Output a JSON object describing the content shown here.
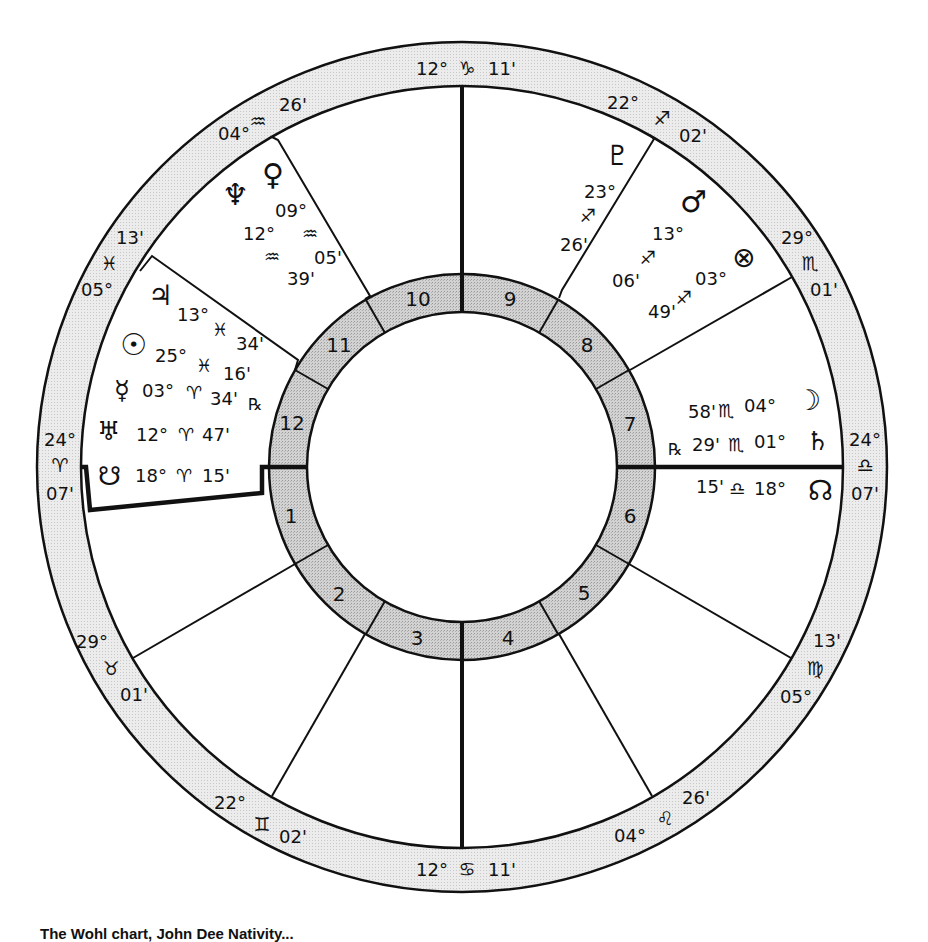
{
  "chart": {
    "center": [
      462,
      467
    ],
    "ring_fill": "#e6e6e6",
    "house_ring_fill": "#cfcfcf",
    "line_color": "#111111"
  },
  "cusps": [
    {
      "house": 1,
      "label_deg": "24°",
      "sign": "♈",
      "sign_name": "aries",
      "label_min": "07'"
    },
    {
      "house": 2,
      "label_deg": "29°",
      "sign": "♉",
      "sign_name": "taurus",
      "label_min": "01'"
    },
    {
      "house": 3,
      "label_deg": "22°",
      "sign": "♊",
      "sign_name": "gemini",
      "label_min": "02'"
    },
    {
      "house": 4,
      "label_deg": "12°",
      "sign": "♋",
      "sign_name": "cancer",
      "label_min": "11'"
    },
    {
      "house": 5,
      "label_deg": "04°",
      "sign": "♌",
      "sign_name": "leo",
      "label_min": "26'"
    },
    {
      "house": 6,
      "label_deg": "05°",
      "sign": "♍",
      "sign_name": "virgo",
      "label_min": "13'"
    },
    {
      "house": 7,
      "label_deg": "24°",
      "sign": "♎",
      "sign_name": "libra",
      "label_min": "07'"
    },
    {
      "house": 8,
      "label_deg": "29°",
      "sign": "♏",
      "sign_name": "scorpio",
      "label_min": "01'"
    },
    {
      "house": 9,
      "label_deg": "22°",
      "sign": "♐",
      "sign_name": "sagittarius",
      "label_min": "02'"
    },
    {
      "house": 10,
      "label_deg": "12°",
      "sign": "♑",
      "sign_name": "capricorn",
      "label_min": "11'"
    },
    {
      "house": 11,
      "label_deg": "04°",
      "sign": "♒",
      "sign_name": "aquarius",
      "label_min": "26'"
    },
    {
      "house": 12,
      "label_deg": "05°",
      "sign": "♓",
      "sign_name": "pisces",
      "label_min": "13'"
    }
  ],
  "house_numbers": [
    "1",
    "2",
    "3",
    "4",
    "5",
    "6",
    "7",
    "8",
    "9",
    "10",
    "11",
    "12"
  ],
  "planets": [
    {
      "name": "neptune",
      "glyph": "♆",
      "deg": "12°",
      "sign": "♒",
      "min": "39'",
      "retro": ""
    },
    {
      "name": "venus",
      "glyph": "♀",
      "deg": "09°",
      "sign": "♒",
      "min": "05'",
      "retro": ""
    },
    {
      "name": "pluto",
      "glyph": "♇",
      "deg": "23°",
      "sign": "♐",
      "min": "26'",
      "retro": ""
    },
    {
      "name": "mars",
      "glyph": "♂",
      "deg": "13°",
      "sign": "♐",
      "min": "06'",
      "retro": ""
    },
    {
      "name": "part-of-fortune",
      "glyph": "⊗",
      "deg": "03°",
      "sign": "♐",
      "min": "49'",
      "retro": ""
    },
    {
      "name": "jupiter",
      "glyph": "♃",
      "deg": "13°",
      "sign": "♓",
      "min": "34'",
      "retro": ""
    },
    {
      "name": "sun",
      "glyph": "☉",
      "deg": "25°",
      "sign": "♓",
      "min": "16'",
      "retro": ""
    },
    {
      "name": "mercury",
      "glyph": "☿",
      "deg": "03°",
      "sign": "♈",
      "min": "34'",
      "retro": "℞"
    },
    {
      "name": "uranus",
      "glyph": "♅",
      "deg": "12°",
      "sign": "♈",
      "min": "47'",
      "retro": ""
    },
    {
      "name": "south-node",
      "glyph": "☋",
      "deg": "18°",
      "sign": "♈",
      "min": "15'",
      "retro": ""
    },
    {
      "name": "moon",
      "glyph": "☽",
      "deg": "04°",
      "sign": "♏",
      "min": "58'",
      "retro": ""
    },
    {
      "name": "saturn",
      "glyph": "♄",
      "deg": "01°",
      "sign": "♏",
      "min": "29'",
      "retro": "℞"
    },
    {
      "name": "north-node",
      "glyph": "☊",
      "deg": "18°",
      "sign": "♎",
      "min": "15'",
      "retro": ""
    }
  ],
  "caption": "The Wohl chart, John Dee Nativity..."
}
